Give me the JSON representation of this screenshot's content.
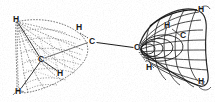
{
  "figure": {
    "background_color": "#ffffff",
    "line_color": "#1a1a1a",
    "label_color": "#181818",
    "width": 215,
    "height": 102,
    "left_group": {
      "name": "methyl-group-left",
      "render_style": "dashed-stippled-wireframe",
      "atoms": [
        {
          "id": "l-c",
          "element": "C",
          "x": 41.5,
          "y": 60.0
        },
        {
          "id": "l-h1",
          "element": "H",
          "x": 16.0,
          "y": 20.0
        },
        {
          "id": "l-h2",
          "element": "H",
          "x": 19.0,
          "y": 92.0
        },
        {
          "id": "l-h3",
          "element": "H",
          "x": 60.5,
          "y": 74.0
        }
      ],
      "bonds": [
        {
          "from": "l-c",
          "to": "l-h1"
        },
        {
          "from": "l-c",
          "to": "l-h2"
        },
        {
          "from": "l-c",
          "to": "l-h3"
        }
      ]
    },
    "right_group": {
      "name": "methyl-group-right",
      "render_style": "solid-curved-mesh-wireframe",
      "atoms": [
        {
          "id": "r-c",
          "element": "C",
          "x": 183.5,
          "y": 36.0
        },
        {
          "id": "r-h1",
          "element": "H",
          "x": 167.5,
          "y": 26.0
        },
        {
          "id": "r-h2",
          "element": "H",
          "x": 201.5,
          "y": 10.0
        },
        {
          "id": "r-h3",
          "element": "H",
          "x": 201.5,
          "y": 82.0
        },
        {
          "id": "r-h4",
          "element": "H",
          "x": 149.5,
          "y": 68.0
        }
      ],
      "bonds": [
        {
          "from": "r-c",
          "to": "r-h1"
        },
        {
          "from": "r-c",
          "to": "r-h4"
        }
      ]
    },
    "central_bond": {
      "name": "carbon-carbon-bond",
      "label_left": "C",
      "label_right": "C",
      "left_x": 92.5,
      "left_y": 42.0,
      "right_x": 137.5,
      "right_y": 48.0
    },
    "labels": [
      {
        "id": "lbl-l-h-top",
        "text": "H",
        "x": 13,
        "y": 15
      },
      {
        "id": "lbl-l-c",
        "text": "C",
        "x": 38,
        "y": 55
      },
      {
        "id": "lbl-l-h-bottom",
        "text": "H",
        "x": 15,
        "y": 87
      },
      {
        "id": "lbl-l-h-right",
        "text": "H",
        "x": 57,
        "y": 69
      },
      {
        "id": "lbl-mid-h",
        "text": "H",
        "x": 76,
        "y": 23
      },
      {
        "id": "lbl-mid-c",
        "text": "C",
        "x": 89,
        "y": 37
      },
      {
        "id": "lbl-r-c-left",
        "text": "C",
        "x": 134,
        "y": 43
      },
      {
        "id": "lbl-r-h-low",
        "text": "H",
        "x": 146,
        "y": 63
      },
      {
        "id": "lbl-r-h-mid",
        "text": "H",
        "x": 164,
        "y": 21
      },
      {
        "id": "lbl-r-c",
        "text": "C",
        "x": 180,
        "y": 31
      },
      {
        "id": "lbl-r-h-top",
        "text": "H",
        "x": 198,
        "y": 5
      },
      {
        "id": "lbl-r-h-bottom",
        "text": "H",
        "x": 198,
        "y": 77
      }
    ]
  }
}
